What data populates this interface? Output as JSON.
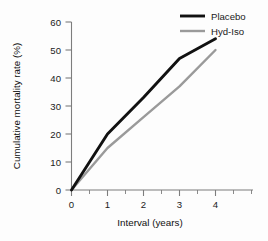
{
  "chart_data": {
    "type": "line",
    "title": "",
    "xlabel": "Interval (years)",
    "ylabel": "Cumulative mortality rate (%)",
    "x": [
      0,
      1,
      2,
      3,
      4
    ],
    "xlim": [
      0,
      4.2
    ],
    "ylim": [
      0,
      60
    ],
    "xticks": [
      0,
      1,
      2,
      3,
      4
    ],
    "yticks": [
      0,
      10,
      20,
      30,
      40,
      50,
      60
    ],
    "xtick_labels": [
      "0",
      "1",
      "2",
      "3",
      "4"
    ],
    "ytick_labels": [
      "0",
      "10",
      "20",
      "30",
      "40",
      "50",
      "60"
    ],
    "grid": false,
    "legend_position": "top-right",
    "series": [
      {
        "name": "Placebo",
        "color": "#111111",
        "values": [
          0,
          20,
          33,
          47,
          54
        ]
      },
      {
        "name": "Hyd-Iso",
        "color": "#9a9a9a",
        "values": [
          0,
          15,
          26,
          37,
          50
        ]
      }
    ]
  },
  "axis": {
    "x_title": "Interval (years)",
    "y_title": "Cumulative mortality rate (%)",
    "y_tick_0": "0",
    "y_tick_10": "10",
    "y_tick_20": "20",
    "y_tick_30": "30",
    "y_tick_40": "40",
    "y_tick_50": "50",
    "y_tick_60": "60",
    "x_tick_0": "0",
    "x_tick_1": "1",
    "x_tick_2": "2",
    "x_tick_3": "3",
    "x_tick_4": "4"
  },
  "legend": {
    "entries": [
      {
        "label": "Placebo",
        "color": "#111111"
      },
      {
        "label": "Hyd-Iso",
        "color": "#9a9a9a"
      }
    ]
  },
  "colors": {
    "placebo": "#111111",
    "hyd_iso": "#9a9a9a",
    "axis": "#7d7d7d",
    "text": "#1b1b1b",
    "background": "#fdfdfd"
  }
}
